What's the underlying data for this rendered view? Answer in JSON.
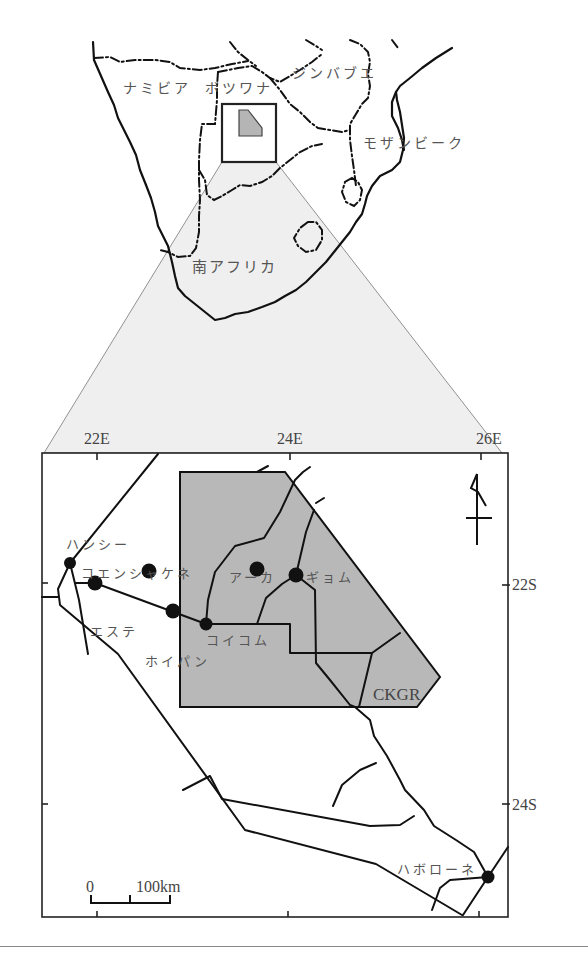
{
  "overview_map": {
    "labels": {
      "namibia": "ナミビア",
      "botswana": "ボツワナ",
      "zimbabwe": "ジンバブエ",
      "mozambique": "モザンビーク",
      "south_africa": "南アフリカ"
    },
    "colors": {
      "zoom_wedge": "#eeeeee",
      "study_area": "#b5b5b5",
      "lines": "#111111"
    }
  },
  "detail_map": {
    "longitude_ticks": [
      "22E",
      "24E",
      "26E"
    ],
    "latitude_ticks": [
      "22S",
      "24S"
    ],
    "reserve_label": "CKGR",
    "towns": [
      {
        "name": "ハンシー"
      },
      {
        "name": "コエンシャケネ"
      },
      {
        "name": "エステ"
      },
      {
        "name": "ホイパン"
      },
      {
        "name": "コイコム"
      },
      {
        "name": "アーカ"
      },
      {
        "name": "ギョム"
      },
      {
        "name": "ハボローネ"
      }
    ],
    "scale_bar": {
      "start_label": "0",
      "end_label": "100km"
    },
    "north_arrow": "north-arrow",
    "colors": {
      "reserve_fill": "#b8b8b8",
      "background": "#ffffff"
    }
  }
}
